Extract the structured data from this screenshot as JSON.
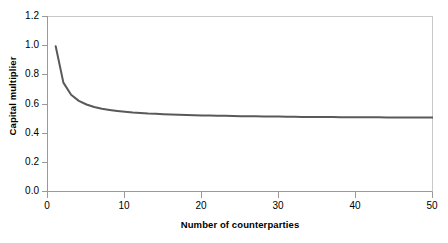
{
  "chart_data": {
    "type": "line",
    "title": "",
    "xlabel": "Number of counterparties",
    "ylabel": "Capital multiplier",
    "xlim": [
      0,
      50
    ],
    "ylim": [
      0.0,
      1.2
    ],
    "xticks": [
      "0",
      "10",
      "20",
      "30",
      "40",
      "50"
    ],
    "xtick_values": [
      0,
      10,
      20,
      30,
      40,
      50
    ],
    "yticks": [
      "0.0",
      "0.2",
      "0.4",
      "0.6",
      "0.8",
      "1.0",
      "1.2"
    ],
    "ytick_values": [
      0.0,
      0.2,
      0.4,
      0.6,
      0.8,
      1.0,
      1.2
    ],
    "grid": false,
    "legend": null,
    "series": [
      {
        "name": "Capital multiplier",
        "color": "#595959",
        "linewidth": 2,
        "x": [
          1,
          2,
          3,
          4,
          5,
          6,
          7,
          8,
          9,
          10,
          11,
          12,
          13,
          14,
          15,
          16,
          17,
          18,
          19,
          20,
          21,
          22,
          23,
          24,
          25,
          26,
          27,
          28,
          29,
          30,
          31,
          32,
          33,
          34,
          35,
          36,
          37,
          38,
          39,
          40,
          41,
          42,
          43,
          44,
          45,
          46,
          47,
          48,
          49,
          50
        ],
        "values": [
          1.0,
          0.75,
          0.667,
          0.625,
          0.6,
          0.583,
          0.571,
          0.563,
          0.556,
          0.55,
          0.545,
          0.542,
          0.538,
          0.536,
          0.533,
          0.531,
          0.529,
          0.528,
          0.526,
          0.525,
          0.524,
          0.523,
          0.522,
          0.521,
          0.52,
          0.519,
          0.519,
          0.518,
          0.517,
          0.517,
          0.516,
          0.516,
          0.515,
          0.515,
          0.514,
          0.514,
          0.514,
          0.513,
          0.513,
          0.513,
          0.512,
          0.512,
          0.512,
          0.511,
          0.511,
          0.511,
          0.511,
          0.51,
          0.51,
          0.51
        ]
      }
    ],
    "axis_color": "#9a9a9a"
  }
}
